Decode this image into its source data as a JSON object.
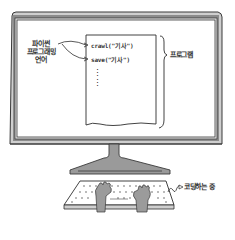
{
  "illustration": {
    "left_label": {
      "line1": "파이썬",
      "line2": "프로그래밍",
      "line3": "언어"
    },
    "code_lines": [
      "crawl(\"기사\")",
      "save(\"기사\")"
    ],
    "ellipsis": "⋮",
    "brace_label": "프로그램",
    "status_label": "코딩하는 중"
  },
  "colors": {
    "frame": "#8c8c8c",
    "bezel": "#d9d9d9",
    "stand": "#9a9a9a",
    "outline": "#3a3a3a",
    "hand": "#9b9b9b",
    "screen": "#ffffff"
  }
}
